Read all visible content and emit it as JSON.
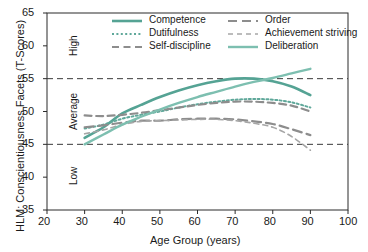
{
  "chart_data": {
    "type": "line",
    "title": "",
    "xlabel": "Age Group (years)",
    "ylabel": "HLM: Conscientiousness Facets (T-Scores)",
    "xlim": [
      20,
      100
    ],
    "ylim": [
      35,
      65
    ],
    "xticks": [
      20,
      30,
      40,
      50,
      60,
      70,
      80,
      90,
      100
    ],
    "yticks": [
      35,
      40,
      45,
      50,
      55,
      60,
      65
    ],
    "grid": false,
    "reference_lines": [
      45,
      55
    ],
    "band_labels": [
      "High",
      "Average",
      "Low"
    ],
    "legend_position": "top-inside",
    "x": [
      30,
      35,
      40,
      45,
      50,
      55,
      60,
      65,
      70,
      75,
      80,
      85,
      90
    ],
    "series": [
      {
        "name": "Competence",
        "color": "#55a394",
        "style": "solid",
        "width": 2.6,
        "values": [
          46.0,
          47.6,
          49.7,
          51.0,
          52.2,
          53.2,
          54.0,
          54.6,
          55.0,
          55.0,
          54.6,
          53.8,
          52.5
        ]
      },
      {
        "name": "Dutifulness",
        "color": "#5fa89a",
        "style": "dotted",
        "width": 2.0,
        "values": [
          47.4,
          48.0,
          48.9,
          49.5,
          50.0,
          50.6,
          51.1,
          51.5,
          51.8,
          51.9,
          51.8,
          51.4,
          50.6
        ]
      },
      {
        "name": "Self-discipline",
        "color": "#8d8d8d",
        "style": "dashed",
        "width": 2.2,
        "values": [
          49.4,
          49.3,
          49.5,
          49.8,
          50.2,
          50.6,
          51.0,
          51.3,
          51.5,
          51.5,
          51.3,
          50.9,
          50.0
        ]
      },
      {
        "name": "Order",
        "color": "#8d8d8d",
        "style": "dashed-long",
        "width": 2.2,
        "values": [
          47.6,
          47.9,
          48.3,
          48.6,
          48.6,
          48.8,
          48.9,
          48.9,
          48.8,
          48.5,
          48.1,
          47.3,
          46.4
        ]
      },
      {
        "name": "Achievement striving",
        "color": "#a6a6a6",
        "style": "dashed-fine",
        "width": 1.6,
        "values": [
          46.6,
          47.2,
          48.0,
          48.5,
          48.6,
          48.7,
          48.8,
          48.8,
          48.6,
          48.2,
          47.6,
          46.2,
          44.1
        ]
      },
      {
        "name": "Deliberation",
        "color": "#7dbfb0",
        "style": "solid",
        "width": 2.4,
        "values": [
          45.0,
          46.5,
          48.0,
          49.2,
          50.3,
          51.3,
          52.2,
          53.0,
          53.8,
          54.5,
          55.1,
          55.8,
          56.5
        ]
      }
    ]
  }
}
